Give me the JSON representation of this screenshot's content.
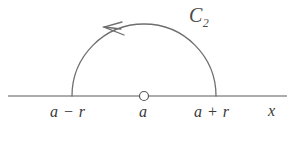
{
  "figure": {
    "type": "contour-diagram",
    "background_color": "#ffffff",
    "stroke_color": "#6e6e6e",
    "axis_color": "#5a5a5a",
    "text_color": "#3a3a3a"
  },
  "axis": {
    "name": "x-axis",
    "label": "x",
    "y_position": 96,
    "x_start": 8,
    "x_end": 287
  },
  "contour": {
    "label_letter": "C",
    "label_subscript": "2",
    "center_x": 144,
    "radius": 72,
    "apex_y": 24,
    "direction": "counterclockwise",
    "arrow_direction": "left"
  },
  "marker": {
    "name": "center-point",
    "style": "open-circle",
    "x": 144,
    "y": 96,
    "radius": 4.5
  },
  "ticks": [
    {
      "id": "left",
      "label_a": "a",
      "operator": "−",
      "label_r": "r",
      "x": 72
    },
    {
      "id": "center",
      "label_a": "a",
      "operator": "",
      "label_r": "",
      "x": 144
    },
    {
      "id": "right",
      "label_a": "a",
      "operator": "+",
      "label_r": "r",
      "x": 216
    }
  ],
  "labels": {
    "left_tick": "a − r",
    "center_tick": "a",
    "right_tick": "a + r",
    "axis": "x"
  }
}
